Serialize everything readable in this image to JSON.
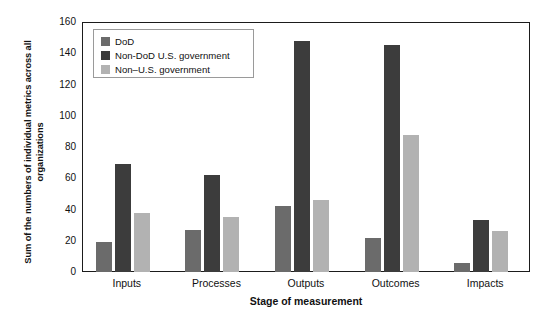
{
  "chart_data": {
    "type": "bar",
    "title": "",
    "xlabel": "Stage of measurement",
    "ylabel": "Sum of the numbers of individual metrics across all organizations",
    "categories": [
      "Inputs",
      "Processes",
      "Outputs",
      "Outcomes",
      "Impacts"
    ],
    "series": [
      {
        "name": "DoD",
        "color": "#6b6b6b",
        "values": [
          19,
          27,
          42,
          22,
          6
        ]
      },
      {
        "name": "Non-DoD U.S. government",
        "color": "#3c3c3c",
        "values": [
          69,
          62,
          148,
          145,
          33
        ]
      },
      {
        "name": "Non–U.S. government",
        "color": "#b2b2b2",
        "values": [
          38,
          35,
          46,
          88,
          26
        ]
      }
    ],
    "ylim": [
      0,
      160
    ],
    "yticks": [
      0,
      20,
      40,
      60,
      80,
      100,
      120,
      140,
      160
    ],
    "ytick_labels": [
      "0",
      "20",
      "40",
      "60",
      "80",
      "100",
      "120",
      "140",
      "160"
    ],
    "grid": false,
    "legend_position": "top-left",
    "legend_entries": [
      "DoD",
      "Non-DoD U.S. government",
      "Non–U.S. government"
    ]
  },
  "axis": {
    "y_title": "Sum of the numbers of individual metrics across all organizations",
    "x_title": "Stage of measurement"
  },
  "colors": {
    "dod": "#6b6b6b",
    "non_dod_us": "#3c3c3c",
    "non_us": "#b2b2b2",
    "frame": "#1b1b1b",
    "background": "#ffffff"
  }
}
